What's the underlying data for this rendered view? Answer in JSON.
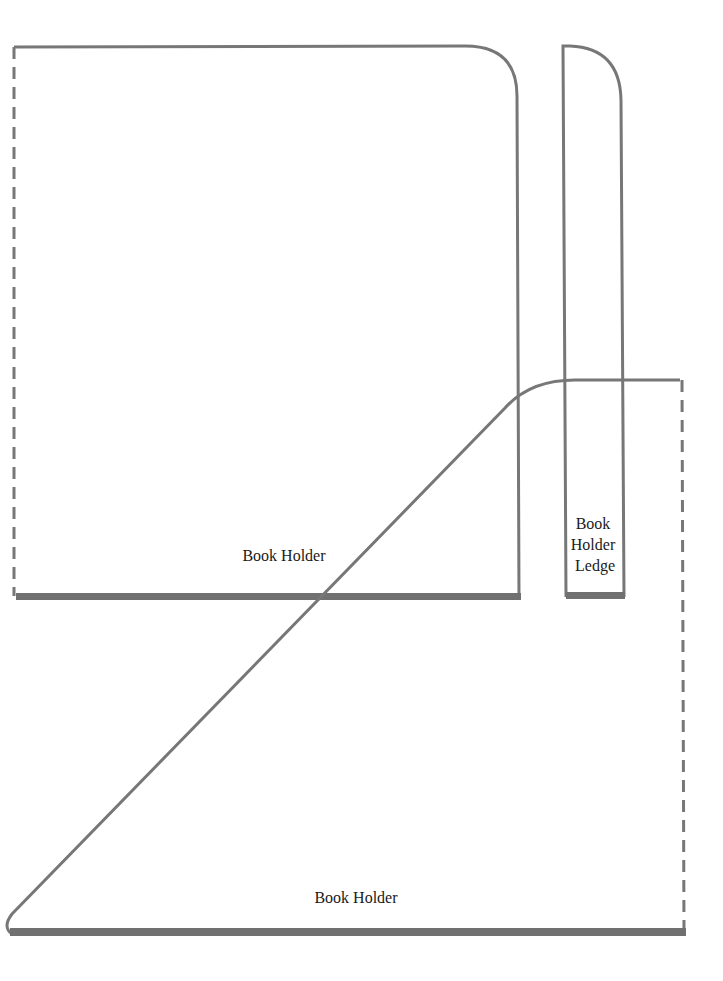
{
  "pattern": {
    "colors": {
      "outline": "#777777",
      "base_edge": "#6f6f6f",
      "label": "#1a1a1a",
      "background": "#ffffff"
    },
    "pieces": [
      {
        "id": "book-holder-back",
        "label": "Book Holder",
        "shape": "rectangle with rounded top-right corner",
        "fold_edge": "left (dashed)",
        "thick_edge": "bottom"
      },
      {
        "id": "book-holder-ledge",
        "label_lines": [
          "Book",
          "Holder",
          "Ledge"
        ],
        "shape": "narrow strip with rounded top-right corner",
        "thick_edge": "bottom"
      },
      {
        "id": "book-holder-side",
        "label": "Book Holder",
        "shape": "triangle with curved top",
        "fold_edge": "right (dashed)",
        "thick_edge": "bottom"
      }
    ]
  }
}
